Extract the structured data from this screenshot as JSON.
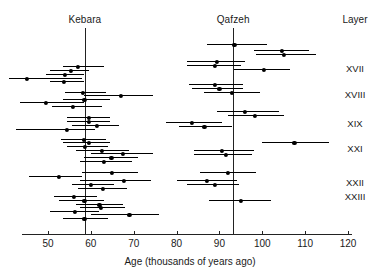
{
  "chart_data": {
    "type": "scatter",
    "title": "",
    "xlabel": "Age (thousands of years ago)",
    "ylabel": "",
    "xlim": [
      42,
      122
    ],
    "xticks": [
      50,
      60,
      70,
      80,
      90,
      100,
      110,
      120
    ],
    "xtick_labels": [
      "50",
      "60",
      "70",
      "80",
      "90",
      "100",
      "110",
      "120"
    ],
    "grid": false,
    "legend": false,
    "orientation": "horizontal-error-bars",
    "site_labels": [
      {
        "name": "Kebara",
        "mean_age": 58.6
      },
      {
        "name": "Qafzeh",
        "mean_age": 93.2
      }
    ],
    "layer_axis_title": "Layer",
    "layer_labels": [
      {
        "label": "XVII",
        "y": 68
      },
      {
        "label": "XVIII",
        "y": 94
      },
      {
        "label": "XIX",
        "y": 123
      },
      {
        "label": "XXI",
        "y": 148
      },
      {
        "label": "XXII",
        "y": 182
      },
      {
        "label": "XXIII",
        "y": 196
      }
    ],
    "series": [
      {
        "name": "Kebara",
        "color": "#000000",
        "points": [
          {
            "y": 66,
            "age": 57.0,
            "low": 53.5,
            "high": 63.0
          },
          {
            "y": 70,
            "age": 55.3,
            "low": 50.5,
            "high": 59.5
          },
          {
            "y": 74,
            "age": 54.0,
            "low": 49.5,
            "high": 58.5
          },
          {
            "y": 78,
            "age": 45.0,
            "low": 41.0,
            "high": 58.0
          },
          {
            "y": 81,
            "age": 53.8,
            "low": 50.5,
            "high": 58.5
          },
          {
            "y": 92,
            "age": 58.2,
            "low": 54.0,
            "high": 63.5
          },
          {
            "y": 95,
            "age": 67.0,
            "low": 58.5,
            "high": 74.5
          },
          {
            "y": 99,
            "age": 58.5,
            "low": 53.5,
            "high": 64.5
          },
          {
            "y": 102,
            "age": 49.6,
            "low": 43.5,
            "high": 58.5
          },
          {
            "y": 106,
            "age": 55.8,
            "low": 51.0,
            "high": 62.5
          },
          {
            "y": 117,
            "age": 59.5,
            "low": 54.5,
            "high": 64.5
          },
          {
            "y": 121,
            "age": 59.6,
            "low": 54.5,
            "high": 64.5
          },
          {
            "y": 125,
            "age": 61.5,
            "low": 55.5,
            "high": 66.5
          },
          {
            "y": 129,
            "age": 54.5,
            "low": 42.5,
            "high": 61.0
          },
          {
            "y": 139,
            "age": 58.3,
            "low": 53.0,
            "high": 63.5
          },
          {
            "y": 142,
            "age": 59.5,
            "low": 53.5,
            "high": 64.5
          },
          {
            "y": 146,
            "age": 58.6,
            "low": 54.5,
            "high": 64.0
          },
          {
            "y": 150,
            "age": 62.5,
            "low": 56.5,
            "high": 69.0
          },
          {
            "y": 153,
            "age": 67.5,
            "low": 60.0,
            "high": 74.5
          },
          {
            "y": 157,
            "age": 64.8,
            "low": 58.5,
            "high": 71.0
          },
          {
            "y": 161,
            "age": 63.0,
            "low": 57.5,
            "high": 69.5
          },
          {
            "y": 172,
            "age": 65.0,
            "low": 58.0,
            "high": 71.0
          },
          {
            "y": 176,
            "age": 52.5,
            "low": 45.5,
            "high": 58.0
          },
          {
            "y": 180,
            "age": 67.8,
            "low": 57.5,
            "high": 74.0
          },
          {
            "y": 184,
            "age": 60.0,
            "low": 55.5,
            "high": 65.5
          },
          {
            "y": 188,
            "age": 62.8,
            "low": 57.0,
            "high": 68.5
          },
          {
            "y": 196,
            "age": 56.0,
            "low": 51.5,
            "high": 61.5
          },
          {
            "y": 200,
            "age": 58.5,
            "low": 52.5,
            "high": 63.0
          },
          {
            "y": 204,
            "age": 62.0,
            "low": 56.5,
            "high": 67.5
          },
          {
            "y": 207,
            "age": 62.3,
            "low": 57.5,
            "high": 68.0
          },
          {
            "y": 211,
            "age": 56.2,
            "low": 50.5,
            "high": 62.0
          },
          {
            "y": 214,
            "age": 69.0,
            "low": 60.0,
            "high": 76.0
          },
          {
            "y": 218,
            "age": 58.5,
            "low": 53.5,
            "high": 64.0
          }
        ]
      },
      {
        "name": "Qafzeh",
        "color": "#000000",
        "points": [
          {
            "y": 44,
            "age": 93.5,
            "low": 87.0,
            "high": 101.0
          },
          {
            "y": 50,
            "age": 104.5,
            "low": 98.0,
            "high": 111.0
          },
          {
            "y": 54,
            "age": 105.0,
            "low": 98.5,
            "high": 112.5
          },
          {
            "y": 61,
            "age": 89.5,
            "low": 82.5,
            "high": 96.0
          },
          {
            "y": 65,
            "age": 89.0,
            "low": 82.5,
            "high": 95.0
          },
          {
            "y": 69,
            "age": 100.3,
            "low": 93.5,
            "high": 106.5
          },
          {
            "y": 84,
            "age": 89.0,
            "low": 83.0,
            "high": 95.5
          },
          {
            "y": 88,
            "age": 90.0,
            "low": 83.5,
            "high": 95.5
          },
          {
            "y": 92,
            "age": 93.0,
            "low": 86.5,
            "high": 99.5
          },
          {
            "y": 111,
            "age": 96.0,
            "low": 89.5,
            "high": 104.0
          },
          {
            "y": 115,
            "age": 98.3,
            "low": 92.0,
            "high": 105.0
          },
          {
            "y": 122,
            "age": 83.5,
            "low": 77.5,
            "high": 90.5
          },
          {
            "y": 126,
            "age": 86.5,
            "low": 80.5,
            "high": 93.0
          },
          {
            "y": 142,
            "age": 107.5,
            "low": 100.0,
            "high": 115.5
          },
          {
            "y": 150,
            "age": 90.5,
            "low": 84.0,
            "high": 98.0
          },
          {
            "y": 154,
            "age": 91.5,
            "low": 84.0,
            "high": 97.5
          },
          {
            "y": 172,
            "age": 92.0,
            "low": 85.5,
            "high": 98.5
          },
          {
            "y": 180,
            "age": 87.0,
            "low": 80.0,
            "high": 94.0
          },
          {
            "y": 184,
            "age": 89.0,
            "low": 82.5,
            "high": 94.5
          },
          {
            "y": 200,
            "age": 95.0,
            "low": 87.5,
            "high": 102.0
          }
        ]
      }
    ]
  },
  "geometry": {
    "x_origin_px": 48,
    "x_origin_value": 50,
    "px_per_unit": 4.2857,
    "axis_y": 234,
    "axis_left_px": 22,
    "axis_right_px": 352,
    "tick_label_y": 238,
    "axis_title_x": 190,
    "axis_title_y": 256,
    "site_label_y": 14,
    "vline_top": 28,
    "layer_header_x": 355,
    "layer_header_y": 14,
    "layer_label_x": 355
  }
}
